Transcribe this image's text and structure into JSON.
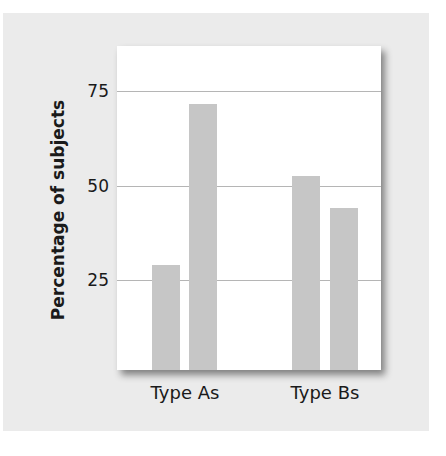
{
  "chart_data": {
    "type": "bar",
    "title": "",
    "xlabel": "",
    "ylabel": "Percentage of subjects",
    "categories": [
      "Type As",
      "Type Bs"
    ],
    "series": [
      {
        "name": "Series 1",
        "values": [
          29,
          52.5
        ]
      },
      {
        "name": "Series 2",
        "values": [
          71.5,
          44
        ]
      }
    ],
    "yticks": [
      25,
      50,
      75
    ],
    "ylim": [
      0,
      85
    ],
    "grid": true,
    "legend": "none",
    "colors": {
      "bar": "#c6c6c6",
      "panel": "#ebebeb",
      "plot_bg": "#ffffff",
      "grid": "#b5b5b5"
    }
  },
  "labels": {
    "ylabel": "Percentage of subjects",
    "ticks": [
      "25",
      "50",
      "75"
    ],
    "categories": [
      "Type As",
      "Type Bs"
    ]
  }
}
